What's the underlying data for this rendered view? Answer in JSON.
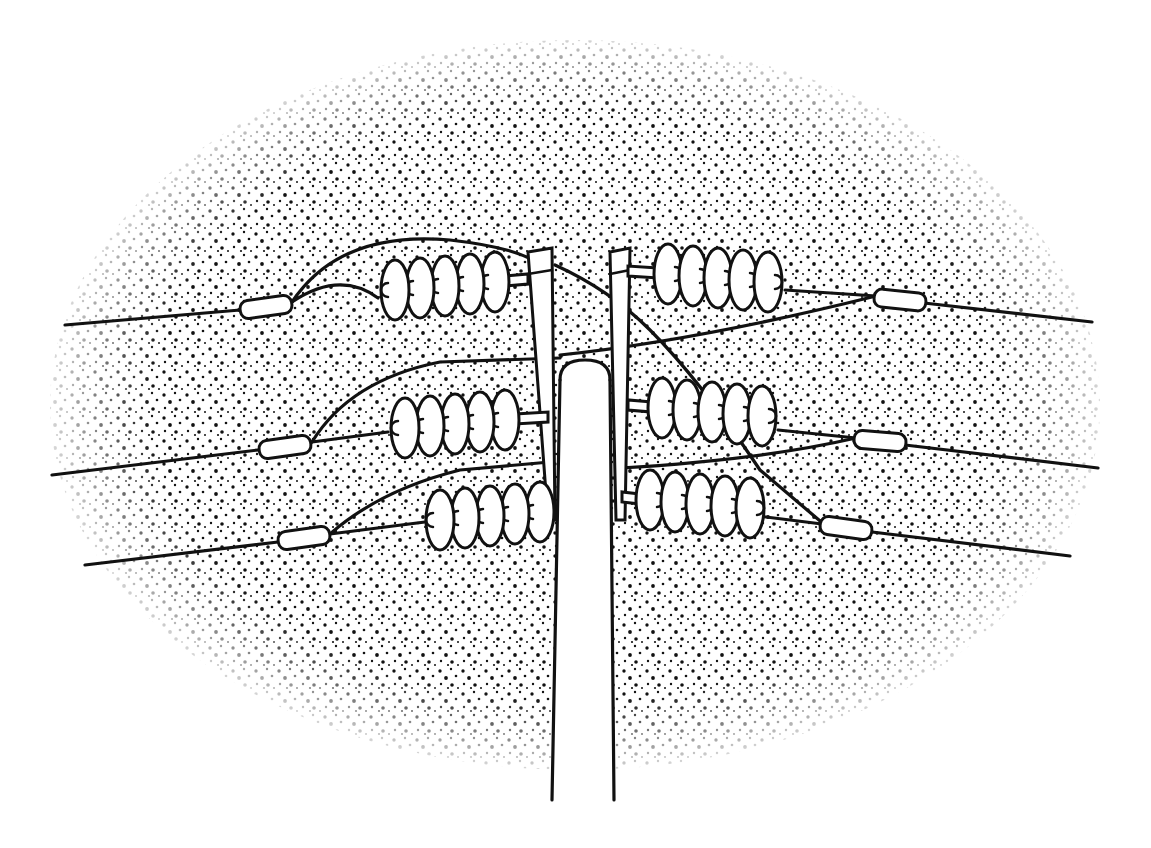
{
  "illustration": {
    "subject": "utility pole with suspension insulator strings and power lines",
    "style": "black line drawing on stippled oval background",
    "colors": {
      "ink": "#111111",
      "background": "#ffffff",
      "stipple": "#111111"
    },
    "canvas": {
      "width": 1151,
      "height": 848
    },
    "stipple_oval": {
      "cx": 575,
      "cy": 405,
      "rx": 525,
      "ry": 365
    },
    "pole": {
      "left_top": 560,
      "right_top": 610,
      "top": 360,
      "bottom": 800
    },
    "braces": [
      {
        "side": "left",
        "points": [
          [
            528,
            252
          ],
          [
            552,
            248
          ],
          [
            555,
            520
          ],
          [
            548,
            520
          ]
        ]
      },
      {
        "side": "right",
        "points": [
          [
            610,
            252
          ],
          [
            630,
            248
          ],
          [
            625,
            520
          ],
          [
            616,
            520
          ]
        ]
      }
    ],
    "insulator_strings": [
      {
        "name": "upper-left",
        "x_start": 395,
        "y": 282,
        "count": 5,
        "dir": -1,
        "pin_to": 528
      },
      {
        "name": "upper-right",
        "x_start": 668,
        "y": 274,
        "count": 5,
        "dir": 1,
        "pin_to": 628
      },
      {
        "name": "middle-left",
        "x_start": 405,
        "y": 420,
        "count": 5,
        "dir": -1,
        "pin_to": 548
      },
      {
        "name": "middle-right",
        "x_start": 662,
        "y": 408,
        "count": 5,
        "dir": 1,
        "pin_to": 628
      },
      {
        "name": "lower-left",
        "x_start": 440,
        "y": 512,
        "count": 5,
        "dir": -1,
        "pin_to": 550
      },
      {
        "name": "lower-right",
        "x_start": 650,
        "y": 500,
        "count": 5,
        "dir": 1,
        "pin_to": 622
      }
    ],
    "sleeves": [
      {
        "name": "sleeve-upper-left",
        "cx": 266,
        "cy": 307,
        "angle": -8
      },
      {
        "name": "sleeve-upper-right",
        "cx": 900,
        "cy": 300,
        "angle": 6
      },
      {
        "name": "sleeve-middle-left",
        "cx": 285,
        "cy": 447,
        "angle": -8
      },
      {
        "name": "sleeve-middle-right",
        "cx": 880,
        "cy": 441,
        "angle": 5
      },
      {
        "name": "sleeve-lower-left",
        "cx": 304,
        "cy": 538,
        "angle": -8
      },
      {
        "name": "sleeve-lower-right",
        "cx": 846,
        "cy": 528,
        "angle": 8
      }
    ],
    "wires": [
      "M 65 325 L 240 310",
      "M 292 302 Q 340 270 378 298",
      "M 292 302 Q 340 230 450 240 Q 520 248 540 265",
      "M 924 303 L 1092 322",
      "M 876 296 L 785 290",
      "M 876 296 Q 700 340 560 355",
      "M 555 265 Q 610 290 650 330 Q 700 380 760 470 L 826 526",
      "M 52 475 L 258 450",
      "M 312 442 Q 350 380 440 362 L 560 358",
      "M 312 442 L 388 432",
      "M 905 445 L 1098 468",
      "M 856 438 L 778 430",
      "M 856 438 Q 760 460 620 468",
      "M 85 565 L 278 542",
      "M 330 534 Q 380 490 460 470 L 550 462",
      "M 330 534 L 425 522",
      "M 872 532 L 1070 556",
      "M 822 524 L 742 514"
    ]
  }
}
